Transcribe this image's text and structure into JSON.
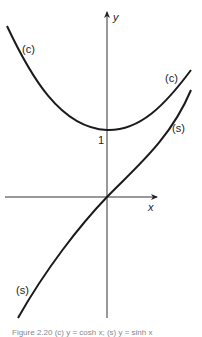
{
  "figure": {
    "axes": {
      "x_label": "x",
      "y_label": "y",
      "y_intercept_label": "1"
    },
    "curves": [
      {
        "id": "c",
        "label": "(c)",
        "description": "hyperbolic cosine-like curve, minimum 1 at x=0"
      },
      {
        "id": "s",
        "label": "(s)",
        "description": "hyperbolic sine-like curve through origin"
      }
    ],
    "labels": {
      "c_left": "(c)",
      "c_right": "(c)",
      "s_right": "(s)",
      "s_left": "(s)"
    },
    "caption": "Figure 2.20  (c) y = cosh x; (s) y = sinh x"
  }
}
